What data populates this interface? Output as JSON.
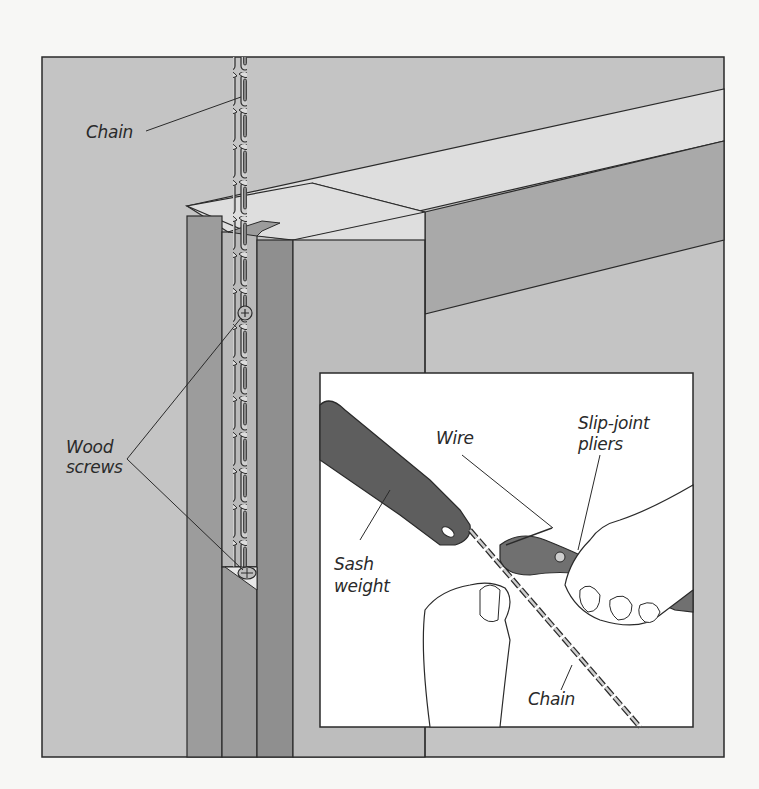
{
  "figure": {
    "type": "technical illustration",
    "colors": {
      "background": "#f7f7f5",
      "wall": "#c4c4c4",
      "jamb_dark": "#9c9c9c",
      "jamb_light": "#bdbdbd",
      "beam_top": "#dedede",
      "beam_face": "#a9a9a9",
      "inset_bg": "#ffffff",
      "outline": "#2a2a2a",
      "sash_weight": "#5e5e5e",
      "pliers": "#707070"
    }
  },
  "labels": {
    "chain_top": "Chain",
    "wood_screws_line1": "Wood",
    "wood_screws_line2": "screws",
    "wire": "Wire",
    "pliers_line1": "Slip-joint",
    "pliers_line2": "pliers",
    "sash_weight_line1": "Sash",
    "sash_weight_line2": "weight",
    "chain_inset": "Chain"
  },
  "inset": {
    "title": "Detail: attaching chain to sash weight with wire"
  }
}
